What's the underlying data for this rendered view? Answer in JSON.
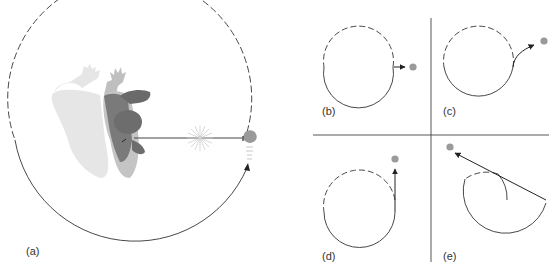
{
  "figure": {
    "panels": [
      {
        "id": "a",
        "label": "(a)",
        "description": "Person swinging object on string in circle; string breaks"
      },
      {
        "id": "b",
        "label": "(b)",
        "description": "Object flies off tangentially (straight line)"
      },
      {
        "id": "c",
        "label": "(c)",
        "description": "Curved outward path"
      },
      {
        "id": "d",
        "label": "(d)",
        "description": "Path continues straight upward"
      },
      {
        "id": "e",
        "label": "(e)",
        "description": "Path heads back toward upper-left"
      }
    ],
    "colors": {
      "line": "#333333",
      "object": "#9a9a9a",
      "person_dark": "#6e6e6e",
      "person_mid": "#8c8c8c",
      "person_light": "#bdbdbd",
      "shadow": "#e4e4e4"
    }
  }
}
